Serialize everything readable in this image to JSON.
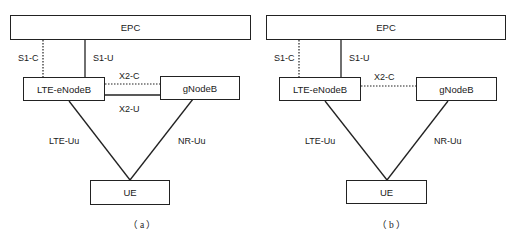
{
  "figure": {
    "panels": [
      {
        "caption": "（a）",
        "nodes": {
          "epc": "EPC",
          "enb": "LTE-eNodeB",
          "gnb": "gNodeB",
          "ue": "UE"
        },
        "links": {
          "s1c": "S1-C",
          "s1u": "S1-U",
          "x2c": "X2-C",
          "x2u": "X2-U",
          "lte_uu": "LTE-Uu",
          "nr_uu": "NR-Uu"
        },
        "has_x2u": true
      },
      {
        "caption": "（b）",
        "nodes": {
          "epc": "EPC",
          "enb": "LTE-eNodeB",
          "gnb": "gNodeB",
          "ue": "UE"
        },
        "links": {
          "s1c": "S1-C",
          "s1u": "S1-U",
          "x2c": "X2-C",
          "lte_uu": "LTE-Uu",
          "nr_uu": "NR-Uu"
        },
        "has_x2u": false
      }
    ],
    "colors": {
      "line": "#222222",
      "text": "#1a1a1a",
      "background": "#ffffff"
    }
  }
}
